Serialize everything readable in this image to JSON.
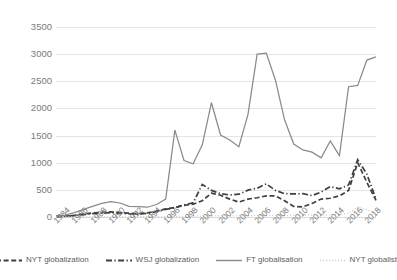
{
  "chart_data": {
    "type": "line",
    "title": "",
    "xlabel": "",
    "ylabel": "",
    "ylim": [
      0,
      3500
    ],
    "ytick_values": [
      0,
      500,
      1000,
      1500,
      2000,
      2500,
      3000,
      3500
    ],
    "ytick_labels": [
      "0",
      "500",
      "1000",
      "1500",
      "2000",
      "2500",
      "3000",
      "3500"
    ],
    "grid": true,
    "legend_position": "bottom",
    "xlim": [
      1984,
      2019
    ],
    "x": [
      1984,
      1985,
      1986,
      1987,
      1988,
      1989,
      1990,
      1991,
      1992,
      1993,
      1994,
      1995,
      1996,
      1997,
      1998,
      1999,
      2000,
      2001,
      2002,
      2003,
      2004,
      2005,
      2006,
      2007,
      2008,
      2009,
      2010,
      2011,
      2012,
      2013,
      2014,
      2015,
      2016,
      2017,
      2018,
      2019
    ],
    "xtick_labels": [
      "1984",
      "1986",
      "1988",
      "1990",
      "1992",
      "1994",
      "1996",
      "1998",
      "2000",
      "2002",
      "2004",
      "2006",
      "2008",
      "2010",
      "2012",
      "2014",
      "2016",
      "2018"
    ],
    "xtick_values": [
      1984,
      1986,
      1988,
      1990,
      1992,
      1994,
      1996,
      1998,
      2000,
      2002,
      2004,
      2006,
      2008,
      2010,
      2012,
      2014,
      2016,
      2018
    ],
    "series": [
      {
        "name": "NYT globalization",
        "style": "dashed",
        "color": "#3f3f3f",
        "values": [
          10,
          15,
          30,
          55,
          75,
          85,
          95,
          80,
          70,
          60,
          75,
          110,
          150,
          175,
          215,
          235,
          300,
          440,
          400,
          330,
          275,
          330,
          355,
          390,
          390,
          300,
          195,
          185,
          250,
          330,
          345,
          390,
          490,
          1000,
          640,
          305
        ]
      },
      {
        "name": "WSJ globalization",
        "style": "dash-dot",
        "color": "#3f3f3f",
        "values": [
          8,
          12,
          25,
          45,
          62,
          70,
          80,
          68,
          58,
          52,
          68,
          100,
          140,
          170,
          225,
          260,
          600,
          490,
          430,
          405,
          420,
          495,
          530,
          610,
          490,
          430,
          425,
          430,
          395,
          460,
          560,
          520,
          590,
          1055,
          790,
          330
        ]
      },
      {
        "name": "FT globalisation",
        "style": "solid",
        "color": "#8a8a8a",
        "values": [
          15,
          35,
          80,
          140,
          195,
          250,
          282,
          258,
          195,
          190,
          180,
          230,
          330,
          1600,
          1040,
          980,
          1330,
          2105,
          1510,
          1420,
          1295,
          1890,
          3000,
          3020,
          2520,
          1790,
          1345,
          1235,
          1195,
          1090,
          1400,
          1130,
          2400,
          2425,
          2890,
          2950
        ]
      },
      {
        "name": "NYT globalist",
        "style": "dotted",
        "color": "#cfcfcf",
        "values": [
          2,
          2,
          3,
          3,
          4,
          4,
          5,
          5,
          5,
          5,
          6,
          6,
          8,
          10,
          12,
          14,
          18,
          22,
          24,
          22,
          24,
          26,
          28,
          30,
          32,
          30,
          32,
          34,
          36,
          38,
          42,
          48,
          68,
          180,
          135,
          75
        ]
      }
    ]
  },
  "legend": {
    "items": [
      {
        "label": "NYT globalization",
        "swatch": "dashed-line-swatch"
      },
      {
        "label": "WSJ globalization",
        "swatch": "dash-dot-line-swatch"
      },
      {
        "label": "FT globalisation",
        "swatch": "solid-line-swatch"
      },
      {
        "label": "NYT globalist",
        "swatch": "dotted-line-swatch"
      }
    ]
  }
}
